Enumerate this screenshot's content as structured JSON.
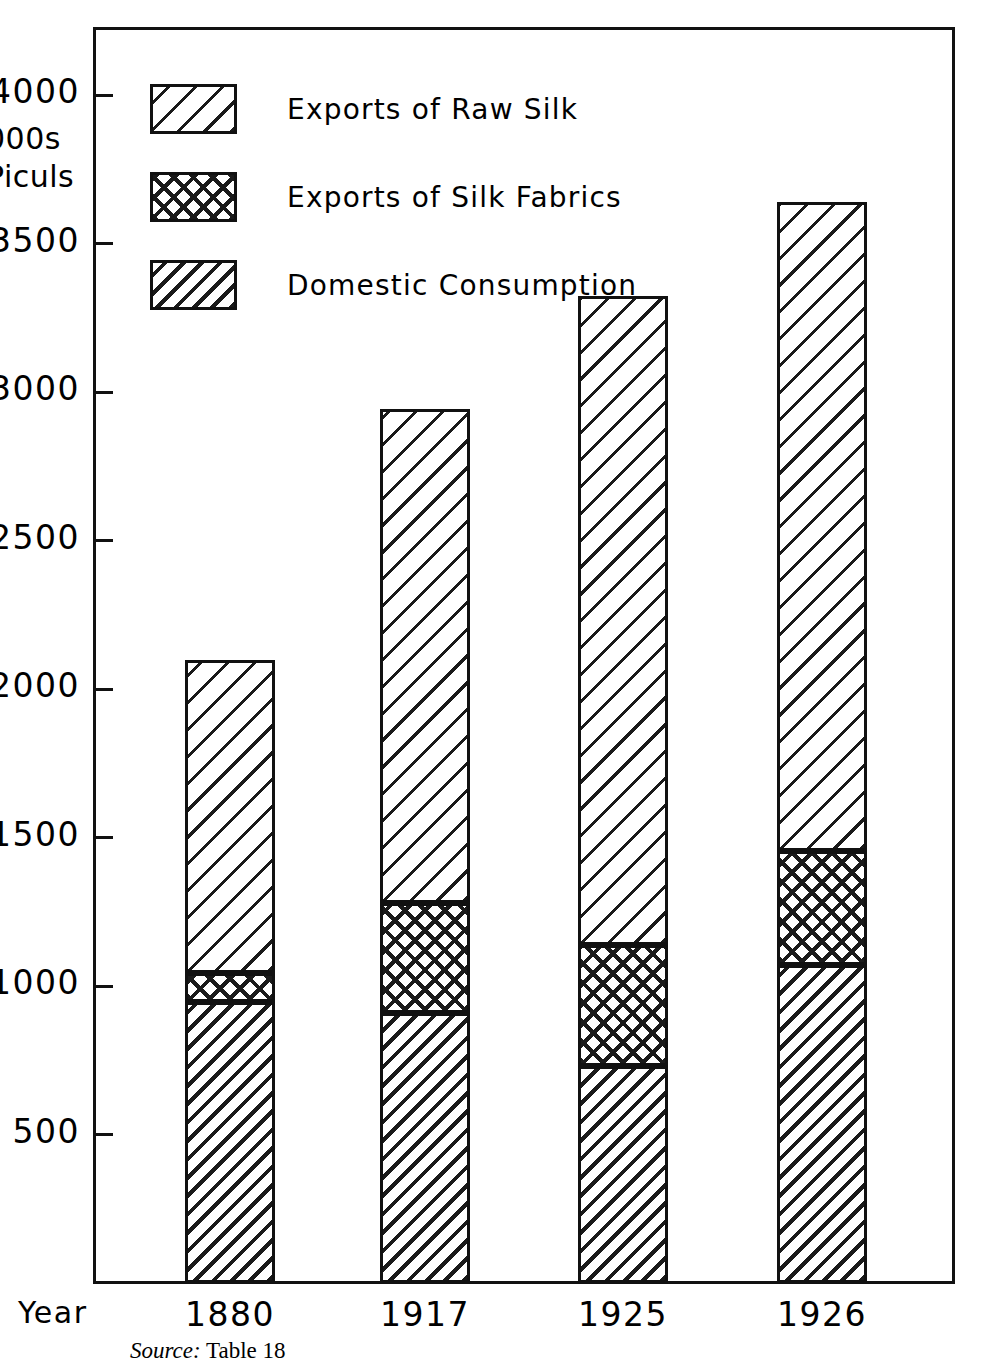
{
  "axis": {
    "y_title": "000s\nPiculs",
    "x_title": "Year",
    "y_ticks": [
      {
        "label": "4000",
        "value": 4000
      },
      {
        "label": "3500",
        "value": 3500
      },
      {
        "label": "3000",
        "value": 3000
      },
      {
        "label": "2500",
        "value": 2500
      },
      {
        "label": "2000",
        "value": 2000
      },
      {
        "label": "1500",
        "value": 1500
      },
      {
        "label": "1000",
        "value": 1000
      },
      {
        "label": "500",
        "value": 500
      }
    ]
  },
  "legend": {
    "items": [
      {
        "label": "Exports of Raw Silk",
        "pattern": "diagonal-hatch-wide"
      },
      {
        "label": "Exports of Silk Fabrics",
        "pattern": "cross-hatch"
      },
      {
        "label": "Domestic Consumption",
        "pattern": "diagonal-hatch-dense"
      }
    ]
  },
  "source_note": {
    "lead": "Source:",
    "text": " Table 18"
  },
  "chart_data": {
    "type": "bar",
    "stacked": true,
    "title": "",
    "xlabel": "Year",
    "ylabel": "000s Piculs",
    "ylim": [
      0,
      4250
    ],
    "grid": false,
    "legend_position": "top-left",
    "categories": [
      "1880",
      "1917",
      "1925",
      "1926"
    ],
    "series": [
      {
        "name": "Domestic Consumption",
        "values": [
          945,
          910,
          730,
          1070
        ]
      },
      {
        "name": "Exports of Silk Fabrics",
        "values": [
          100,
          370,
          410,
          385
        ]
      },
      {
        "name": "Exports of Raw Silk",
        "values": [
          1055,
          1665,
          2185,
          2185
        ]
      }
    ],
    "totals": [
      2100,
      2945,
      3325,
      3640
    ],
    "cumulative_tops": [
      {
        "category": "1880",
        "domestic": 945,
        "plus_fabrics": 1045,
        "total": 2100
      },
      {
        "category": "1917",
        "domestic": 910,
        "plus_fabrics": 1280,
        "total": 2945
      },
      {
        "category": "1925",
        "domestic": 730,
        "plus_fabrics": 1140,
        "total": 3325
      },
      {
        "category": "1926",
        "domestic": 1070,
        "plus_fabrics": 1455,
        "total": 3640
      }
    ]
  },
  "colors": {
    "ink": "#111111",
    "background": "#ffffff"
  }
}
